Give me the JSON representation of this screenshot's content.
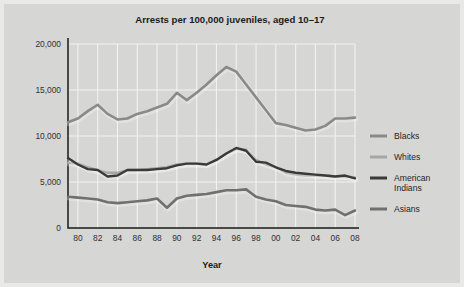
{
  "chart_data": {
    "type": "line",
    "title": "Arrests per 100,000 juveniles, aged 10–17",
    "xlabel": "Year",
    "ylabel": "",
    "grid": true,
    "legend_position": "right",
    "xlim": [
      1979,
      2008
    ],
    "ylim": [
      0,
      20000
    ],
    "ytick_labels": [
      "0",
      "5,000",
      "10,000",
      "15,000",
      "20,000"
    ],
    "ytick_values": [
      0,
      5000,
      10000,
      15000,
      20000
    ],
    "xtick_labels": [
      "80",
      "82",
      "84",
      "86",
      "88",
      "90",
      "92",
      "94",
      "96",
      "98",
      "00",
      "02",
      "04",
      "06",
      "08"
    ],
    "xtick_values": [
      1980,
      1982,
      1984,
      1986,
      1988,
      1990,
      1992,
      1994,
      1996,
      1998,
      2000,
      2002,
      2004,
      2006,
      2008
    ],
    "x": [
      1979,
      1980,
      1981,
      1982,
      1983,
      1984,
      1985,
      1986,
      1987,
      1988,
      1989,
      1990,
      1991,
      1992,
      1993,
      1994,
      1995,
      1996,
      1997,
      1998,
      1999,
      2000,
      2001,
      2002,
      2003,
      2004,
      2005,
      2006,
      2007,
      2008
    ],
    "series": [
      {
        "name": "Blacks",
        "color": "#8a8a88",
        "width": 2.6,
        "values": [
          11500,
          11900,
          12700,
          13400,
          12400,
          11800,
          11900,
          12400,
          12700,
          13100,
          13500,
          14700,
          13900,
          14700,
          15600,
          16600,
          17500,
          17000,
          15600,
          14200,
          12800,
          11400,
          11200,
          10900,
          10600,
          10700,
          11100,
          11900,
          11900,
          12000
        ]
      },
      {
        "name": "Whites",
        "color": "#a6a6a4",
        "width": 2.4,
        "values": [
          7100,
          7000,
          6600,
          6300,
          6000,
          6000,
          6300,
          6300,
          6400,
          6500,
          6600,
          6900,
          7000,
          7000,
          6900,
          7400,
          8100,
          8600,
          8500,
          7400,
          6900,
          6600,
          6000,
          5800,
          5700,
          5700,
          5700,
          5600,
          5600,
          5500
        ]
      },
      {
        "name": "American Indians",
        "color": "#3a3a3a",
        "width": 2.4,
        "values": [
          7600,
          6900,
          6400,
          6300,
          5600,
          5700,
          6300,
          6300,
          6300,
          6400,
          6500,
          6800,
          7000,
          7000,
          6900,
          7400,
          8100,
          8700,
          8400,
          7200,
          7100,
          6600,
          6200,
          6000,
          5900,
          5800,
          5700,
          5600,
          5700,
          5400
        ]
      },
      {
        "name": "Asians",
        "color": "#707070",
        "width": 2.6,
        "values": [
          3400,
          3300,
          3200,
          3100,
          2800,
          2700,
          2800,
          2900,
          3000,
          3200,
          2200,
          3200,
          3500,
          3600,
          3700,
          3900,
          4100,
          4100,
          4200,
          3400,
          3100,
          2900,
          2500,
          2400,
          2300,
          2000,
          1900,
          2000,
          1400,
          1900
        ]
      }
    ],
    "legend": [
      {
        "label": "Blacks",
        "color": "#8a8a88"
      },
      {
        "label": "Whites",
        "color": "#a6a6a4"
      },
      {
        "label": "American Indians",
        "color": "#3a3a3a",
        "label_line1": "American",
        "label_line2": "Indians"
      },
      {
        "label": "Asians",
        "color": "#707070"
      }
    ],
    "colors": {
      "background": "#d6d6d4",
      "grid": "#f2f2f0",
      "axis": "#1a1a1a",
      "text": "#1b1b1b"
    }
  }
}
